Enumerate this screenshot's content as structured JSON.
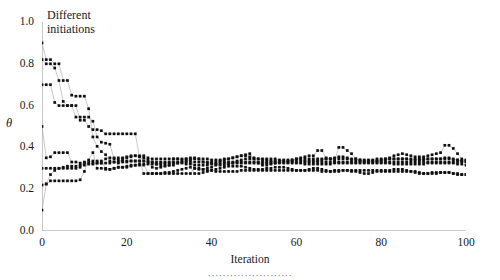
{
  "chart_data": {
    "type": "line",
    "title": "",
    "xlabel": "Iteration",
    "ylabel": "θ",
    "caption": "·······················",
    "xlim": [
      0,
      100
    ],
    "ylim": [
      0.0,
      1.0
    ],
    "xticks": [
      0,
      20,
      40,
      60,
      80,
      100
    ],
    "yticks": [
      0.0,
      0.2,
      0.4,
      0.6,
      0.8,
      1.0
    ],
    "ytick_labels": [
      "0.0",
      "0.2",
      "0.4",
      "0.6",
      "0.8",
      "1.0"
    ],
    "xtick_labels": [
      "0",
      "20",
      "40",
      "60",
      "80",
      "100"
    ],
    "grid": false,
    "legend": null,
    "marker": "filled-square",
    "marker_color": "#101010",
    "line_color": "#9a9a9a",
    "axis_color": "#9a9a9a",
    "annotations": [
      {
        "text": "Different\ninitiations",
        "x": 3,
        "y": 0.97
      }
    ],
    "note": "Seven MCMC/EM-style trajectories started from different initial values of theta; all converge to approximately 0.30-0.35 after roughly 25 iterations, then fluctuate.",
    "converged_value": 0.32,
    "series": [
      {
        "name": "init-0.90",
        "initial": 0.9,
        "values": [
          0.9,
          0.82,
          0.82,
          0.8,
          0.8,
          0.72,
          0.72,
          0.65,
          0.645,
          0.645,
          0.645,
          0.585,
          0.45,
          0.405,
          0.38,
          0.365,
          0.335,
          0.33,
          0.325,
          0.345,
          0.355,
          0.36,
          0.36,
          0.355,
          0.35,
          0.34,
          0.305,
          0.3,
          0.305,
          0.31,
          0.315,
          0.345,
          0.345,
          0.34,
          0.345,
          0.345,
          0.3,
          0.295,
          0.295,
          0.3,
          0.305,
          0.315,
          0.335,
          0.34,
          0.345,
          0.35,
          0.355,
          0.36,
          0.365,
          0.37,
          0.345,
          0.325,
          0.315,
          0.315,
          0.32,
          0.325,
          0.33,
          0.33,
          0.335,
          0.34,
          0.345,
          0.35,
          0.355,
          0.36,
          0.36,
          0.385,
          0.385,
          0.35,
          0.345,
          0.335,
          0.4,
          0.4,
          0.385,
          0.37,
          0.345,
          0.335,
          0.33,
          0.33,
          0.335,
          0.335,
          0.34,
          0.345,
          0.35,
          0.36,
          0.365,
          0.37,
          0.365,
          0.36,
          0.355,
          0.355,
          0.355,
          0.36,
          0.365,
          0.37,
          0.375,
          0.41,
          0.41,
          0.395,
          0.37,
          0.345,
          0.34
        ]
      },
      {
        "name": "init-0.82",
        "initial": 0.82,
        "values": [
          0.82,
          0.8,
          0.8,
          0.78,
          0.72,
          0.62,
          0.6,
          0.6,
          0.6,
          0.53,
          0.53,
          0.5,
          0.485,
          0.485,
          0.48,
          0.465,
          0.465,
          0.465,
          0.465,
          0.465,
          0.465,
          0.465,
          0.465,
          0.355,
          0.335,
          0.33,
          0.33,
          0.32,
          0.315,
          0.315,
          0.315,
          0.315,
          0.325,
          0.33,
          0.335,
          0.34,
          0.345,
          0.345,
          0.33,
          0.325,
          0.325,
          0.32,
          0.315,
          0.315,
          0.32,
          0.325,
          0.335,
          0.34,
          0.345,
          0.345,
          0.345,
          0.345,
          0.345,
          0.345,
          0.345,
          0.345,
          0.34,
          0.335,
          0.33,
          0.335,
          0.34,
          0.34,
          0.335,
          0.335,
          0.335,
          0.335,
          0.34,
          0.345,
          0.345,
          0.35,
          0.355,
          0.355,
          0.35,
          0.345,
          0.345,
          0.34,
          0.335,
          0.335,
          0.335,
          0.335,
          0.335,
          0.34,
          0.345,
          0.345,
          0.345,
          0.345,
          0.345,
          0.34,
          0.34,
          0.34,
          0.34,
          0.345,
          0.345,
          0.345,
          0.345,
          0.35,
          0.35,
          0.345,
          0.34,
          0.335,
          0.335
        ]
      },
      {
        "name": "init-0.70",
        "initial": 0.7,
        "values": [
          0.7,
          0.7,
          0.7,
          0.615,
          0.6,
          0.6,
          0.6,
          0.6,
          0.545,
          0.545,
          0.545,
          0.545,
          0.525,
          0.45,
          0.425,
          0.42,
          0.415,
          0.345,
          0.34,
          0.335,
          0.335,
          0.335,
          0.335,
          0.335,
          0.275,
          0.275,
          0.275,
          0.275,
          0.275,
          0.275,
          0.275,
          0.275,
          0.275,
          0.275,
          0.275,
          0.275,
          0.3,
          0.3,
          0.295,
          0.29,
          0.29,
          0.285,
          0.285,
          0.285,
          0.285,
          0.285,
          0.285,
          0.29,
          0.29,
          0.29,
          0.29,
          0.29,
          0.29,
          0.29,
          0.29,
          0.29,
          0.29,
          0.29,
          0.29,
          0.29,
          0.29,
          0.29,
          0.29,
          0.29,
          0.29,
          0.29,
          0.285,
          0.285,
          0.285,
          0.29,
          0.29,
          0.29,
          0.29,
          0.285,
          0.285,
          0.28,
          0.275,
          0.275,
          0.28,
          0.285,
          0.285,
          0.285,
          0.285,
          0.285,
          0.285,
          0.285,
          0.285,
          0.285,
          0.285,
          0.28,
          0.275,
          0.275,
          0.275,
          0.275,
          0.28,
          0.28,
          0.28,
          0.275,
          0.275,
          0.27,
          0.27
        ]
      },
      {
        "name": "init-0.50",
        "initial": 0.5,
        "values": [
          0.5,
          0.35,
          0.355,
          0.375,
          0.375,
          0.375,
          0.375,
          0.33,
          0.33,
          0.325,
          0.325,
          0.325,
          0.325,
          0.325,
          0.325,
          0.345,
          0.35,
          0.35,
          0.35,
          0.35,
          0.35,
          0.355,
          0.36,
          0.36,
          0.36,
          0.35,
          0.345,
          0.345,
          0.345,
          0.345,
          0.345,
          0.345,
          0.345,
          0.345,
          0.345,
          0.35,
          0.35,
          0.345,
          0.345,
          0.345,
          0.34,
          0.34,
          0.34,
          0.345,
          0.345,
          0.35,
          0.355,
          0.36,
          0.36,
          0.355,
          0.35,
          0.345,
          0.34,
          0.34,
          0.335,
          0.335,
          0.335,
          0.34,
          0.34,
          0.34,
          0.345,
          0.345,
          0.345,
          0.345,
          0.345,
          0.345,
          0.345,
          0.345,
          0.345,
          0.345,
          0.345,
          0.345,
          0.345,
          0.34,
          0.34,
          0.34,
          0.34,
          0.34,
          0.34,
          0.345,
          0.345,
          0.345,
          0.345,
          0.345,
          0.345,
          0.345,
          0.345,
          0.345,
          0.345,
          0.345,
          0.345,
          0.345,
          0.345,
          0.345,
          0.345,
          0.345,
          0.345,
          0.34,
          0.34,
          0.335,
          0.335
        ]
      },
      {
        "name": "init-0.30",
        "initial": 0.3,
        "values": [
          0.3,
          0.3,
          0.3,
          0.3,
          0.3,
          0.3,
          0.3,
          0.3,
          0.3,
          0.305,
          0.33,
          0.33,
          0.335,
          0.335,
          0.335,
          0.3,
          0.295,
          0.3,
          0.305,
          0.305,
          0.305,
          0.31,
          0.315,
          0.315,
          0.315,
          0.32,
          0.32,
          0.32,
          0.325,
          0.325,
          0.325,
          0.325,
          0.325,
          0.325,
          0.32,
          0.32,
          0.315,
          0.315,
          0.315,
          0.315,
          0.32,
          0.32,
          0.32,
          0.325,
          0.325,
          0.325,
          0.325,
          0.325,
          0.325,
          0.325,
          0.325,
          0.325,
          0.325,
          0.325,
          0.325,
          0.325,
          0.325,
          0.325,
          0.325,
          0.325,
          0.325,
          0.325,
          0.32,
          0.32,
          0.32,
          0.32,
          0.32,
          0.32,
          0.32,
          0.325,
          0.325,
          0.325,
          0.325,
          0.325,
          0.325,
          0.325,
          0.325,
          0.325,
          0.325,
          0.325,
          0.325,
          0.325,
          0.325,
          0.32,
          0.32,
          0.32,
          0.32,
          0.32,
          0.32,
          0.32,
          0.32,
          0.325,
          0.325,
          0.325,
          0.325,
          0.325,
          0.325,
          0.325,
          0.32,
          0.32,
          0.315
        ]
      },
      {
        "name": "init-0.22",
        "initial": 0.22,
        "values": [
          0.22,
          0.225,
          0.24,
          0.24,
          0.24,
          0.24,
          0.24,
          0.24,
          0.24,
          0.245,
          0.285,
          0.34,
          0.375,
          0.3,
          0.3,
          0.295,
          0.295,
          0.3,
          0.305,
          0.305,
          0.31,
          0.315,
          0.315,
          0.32,
          0.32,
          0.275,
          0.275,
          0.275,
          0.275,
          0.28,
          0.28,
          0.285,
          0.29,
          0.295,
          0.3,
          0.305,
          0.275,
          0.275,
          0.28,
          0.285,
          0.29,
          0.295,
          0.3,
          0.305,
          0.31,
          0.31,
          0.31,
          0.31,
          0.305,
          0.3,
          0.295,
          0.295,
          0.295,
          0.3,
          0.3,
          0.305,
          0.305,
          0.305,
          0.3,
          0.295,
          0.29,
          0.29,
          0.29,
          0.295,
          0.3,
          0.3,
          0.295,
          0.29,
          0.285,
          0.285,
          0.285,
          0.29,
          0.29,
          0.29,
          0.29,
          0.29,
          0.29,
          0.29,
          0.29,
          0.29,
          0.29,
          0.29,
          0.29,
          0.295,
          0.295,
          0.295,
          0.29,
          0.285,
          0.28,
          0.275,
          0.275,
          0.275,
          0.28,
          0.28,
          0.28,
          0.28,
          0.28,
          0.275,
          0.27,
          0.27,
          0.27
        ]
      },
      {
        "name": "init-0.10",
        "initial": 0.1,
        "values": [
          0.1,
          0.225,
          0.27,
          0.29,
          0.3,
          0.305,
          0.31,
          0.31,
          0.31,
          0.315,
          0.315,
          0.32,
          0.32,
          0.325,
          0.325,
          0.325,
          0.325,
          0.33,
          0.33,
          0.33,
          0.33,
          0.335,
          0.335,
          0.335,
          0.335,
          0.33,
          0.33,
          0.33,
          0.33,
          0.33,
          0.33,
          0.33,
          0.33,
          0.33,
          0.33,
          0.33,
          0.33,
          0.33,
          0.33,
          0.33,
          0.33,
          0.33,
          0.33,
          0.33,
          0.33,
          0.33,
          0.33,
          0.33,
          0.33,
          0.33,
          0.33,
          0.33,
          0.33,
          0.33,
          0.33,
          0.33,
          0.33,
          0.33,
          0.33,
          0.33,
          0.33,
          0.33,
          0.33,
          0.33,
          0.33,
          0.33,
          0.33,
          0.33,
          0.33,
          0.33,
          0.33,
          0.33,
          0.33,
          0.33,
          0.33,
          0.33,
          0.33,
          0.33,
          0.33,
          0.33,
          0.33,
          0.33,
          0.33,
          0.33,
          0.33,
          0.33,
          0.33,
          0.33,
          0.33,
          0.33,
          0.33,
          0.33,
          0.33,
          0.33,
          0.33,
          0.33,
          0.33,
          0.33,
          0.33,
          0.33,
          0.33
        ]
      }
    ]
  }
}
